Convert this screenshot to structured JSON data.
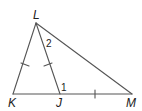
{
  "diagram": {
    "type": "triangle-geometry",
    "stroke_color": "#555555",
    "vertices": {
      "L": {
        "x": 36,
        "y": 23,
        "label": "L",
        "label_x": 33,
        "label_y": 19
      },
      "K": {
        "x": 13,
        "y": 94,
        "label": "K",
        "label_x": 8,
        "label_y": 107
      },
      "J": {
        "x": 60,
        "y": 94,
        "label": "J",
        "label_x": 56,
        "label_y": 107
      },
      "M": {
        "x": 132,
        "y": 94,
        "label": "M",
        "label_x": 126,
        "label_y": 107
      }
    },
    "segments": [
      "LK",
      "LJ",
      "LM",
      "KM"
    ],
    "angle_labels": [
      {
        "text": "2",
        "x": 46,
        "y": 47,
        "at": "angle KLJ side near L"
      },
      {
        "text": "1",
        "x": 61,
        "y": 91,
        "at": "angle LJM"
      }
    ],
    "congruence_marks": [
      {
        "segment": "LK",
        "ticks": 1
      },
      {
        "segment": "LJ",
        "ticks": 1
      },
      {
        "segment": "JM",
        "ticks": 1
      }
    ]
  }
}
